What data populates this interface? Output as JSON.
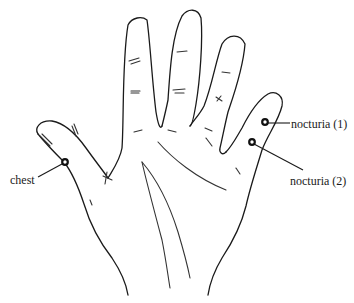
{
  "diagram": {
    "points": [
      {
        "id": "nocturia-1",
        "label": "nocturia (1)",
        "x": 265,
        "y": 122,
        "label_x": 291,
        "label_y": 118
      },
      {
        "id": "nocturia-2",
        "label": "nocturia (2)",
        "x": 252,
        "y": 142,
        "label_x": 290,
        "label_y": 175
      },
      {
        "id": "chest",
        "label": "chest",
        "x": 65,
        "y": 162,
        "label_x": 10,
        "label_y": 175
      }
    ],
    "colors": {
      "line": "#1a1a1a",
      "background": "#ffffff"
    }
  }
}
